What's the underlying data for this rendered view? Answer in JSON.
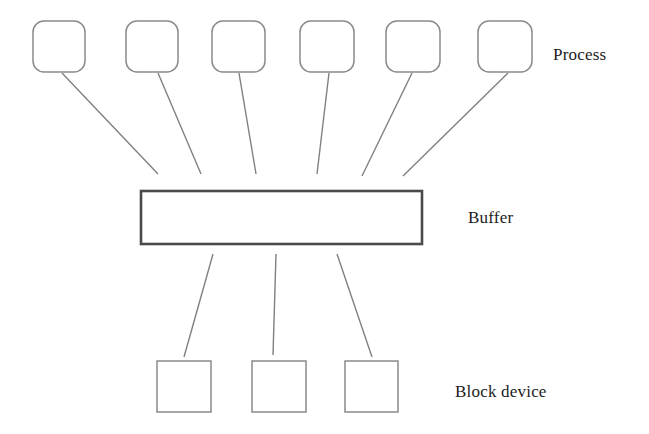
{
  "diagram": {
    "background_color": "#ffffff",
    "line_color": "#808080",
    "box_stroke_color": "#808080",
    "buffer_stroke_color": "#4a4a4a",
    "text_color": "#1c1c1c",
    "labels": {
      "process": "Process",
      "buffer": "Buffer",
      "block_device": "Block device"
    },
    "layers": [
      {
        "name": "process-layer",
        "label": "Process",
        "shape": "rounded-rectangle",
        "count": 6,
        "nodes": [
          {
            "id": "process-1",
            "x": 33,
            "y": 21,
            "w": 52,
            "h": 51
          },
          {
            "id": "process-2",
            "x": 126,
            "y": 21,
            "w": 52,
            "h": 51
          },
          {
            "id": "process-3",
            "x": 212,
            "y": 21,
            "w": 53,
            "h": 51
          },
          {
            "id": "process-4",
            "x": 300,
            "y": 21,
            "w": 54,
            "h": 51
          },
          {
            "id": "process-5",
            "x": 386,
            "y": 21,
            "w": 54,
            "h": 51
          },
          {
            "id": "process-6",
            "x": 478,
            "y": 21,
            "w": 54,
            "h": 51
          }
        ]
      },
      {
        "name": "buffer-layer",
        "label": "Buffer",
        "shape": "rectangle",
        "count": 1,
        "nodes": [
          {
            "id": "buffer-1",
            "x": 140,
            "y": 190,
            "w": 283,
            "h": 55
          }
        ]
      },
      {
        "name": "block-device-layer",
        "label": "Block device",
        "shape": "rectangle",
        "count": 3,
        "nodes": [
          {
            "id": "block-device-1",
            "x": 157,
            "y": 361,
            "w": 54,
            "h": 51
          },
          {
            "id": "block-device-2",
            "x": 252,
            "y": 361,
            "w": 54,
            "h": 51
          },
          {
            "id": "block-device-3",
            "x": 345,
            "y": 361,
            "w": 53,
            "h": 51
          }
        ]
      }
    ],
    "connectors": [
      {
        "id": "process-1-to-buffer",
        "from": "process-1",
        "to": "buffer-1",
        "x1": 62,
        "y1": 73,
        "x2": 158,
        "y2": 174
      },
      {
        "id": "process-2-to-buffer",
        "from": "process-2",
        "to": "buffer-1",
        "x1": 158,
        "y1": 73,
        "x2": 201,
        "y2": 174
      },
      {
        "id": "process-3-to-buffer",
        "from": "process-3",
        "to": "buffer-1",
        "x1": 239,
        "y1": 73,
        "x2": 256,
        "y2": 174
      },
      {
        "id": "process-4-to-buffer",
        "from": "process-4",
        "to": "buffer-1",
        "x1": 329,
        "y1": 73,
        "x2": 317,
        "y2": 174
      },
      {
        "id": "process-5-to-buffer",
        "from": "process-5",
        "to": "buffer-1",
        "x1": 412,
        "y1": 73,
        "x2": 362,
        "y2": 176
      },
      {
        "id": "process-6-to-buffer",
        "from": "process-6",
        "to": "buffer-1",
        "x1": 508,
        "y1": 73,
        "x2": 403,
        "y2": 176
      },
      {
        "id": "buffer-to-block-device-1",
        "from": "buffer-1",
        "to": "block-device-1",
        "x1": 213,
        "y1": 254,
        "x2": 184,
        "y2": 357
      },
      {
        "id": "buffer-to-block-device-2",
        "from": "buffer-1",
        "to": "block-device-2",
        "x1": 276,
        "y1": 254,
        "x2": 273,
        "y2": 355
      },
      {
        "id": "buffer-to-block-device-3",
        "from": "buffer-1",
        "to": "block-device-3",
        "x1": 337,
        "y1": 254,
        "x2": 372,
        "y2": 357
      }
    ]
  }
}
